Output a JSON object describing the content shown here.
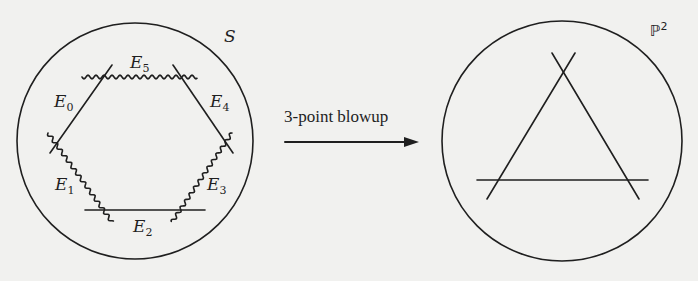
{
  "left_surface": {
    "label": "S",
    "curves": [
      {
        "name": "E",
        "index": "0",
        "style": "straight"
      },
      {
        "name": "E",
        "index": "1",
        "style": "wavy"
      },
      {
        "name": "E",
        "index": "2",
        "style": "straight"
      },
      {
        "name": "E",
        "index": "3",
        "style": "wavy"
      },
      {
        "name": "E",
        "index": "4",
        "style": "straight"
      },
      {
        "name": "E",
        "index": "5",
        "style": "wavy"
      }
    ]
  },
  "arrow": {
    "label": "3-point blowup",
    "direction": "right"
  },
  "right_surface": {
    "label": "ℙ",
    "label_superscript": "2",
    "lines": 3
  },
  "colors": {
    "ink": "#1f1f1f",
    "paper": "#f1f1ef"
  }
}
